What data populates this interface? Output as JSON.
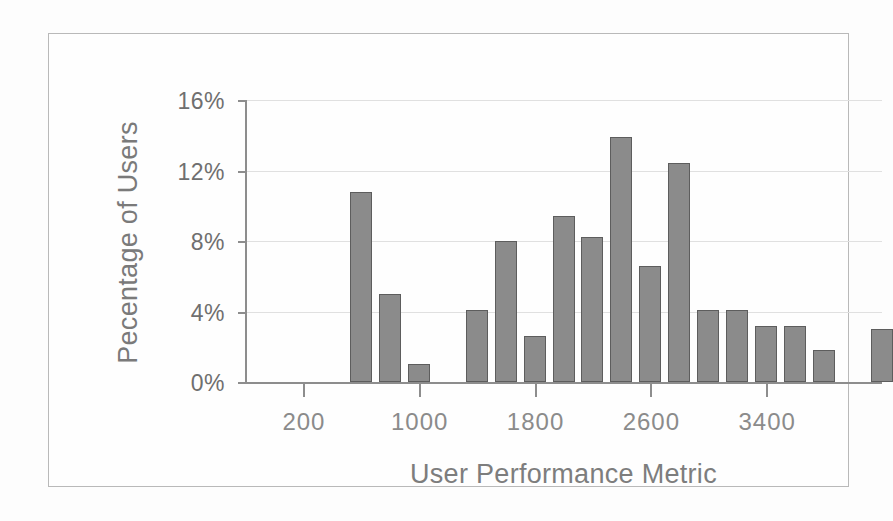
{
  "chart_data": {
    "type": "bar",
    "title": "",
    "subtitle": "",
    "xlabel": "User Performance Metric",
    "ylabel": "Pecentage of Users",
    "ylim": [
      0,
      16
    ],
    "ytick_values": [
      0,
      4,
      8,
      12,
      16
    ],
    "ytick_labels": [
      "0%",
      "4%",
      "8%",
      "12%",
      "16%"
    ],
    "xlim": [
      -200,
      4200
    ],
    "xtick_values": [
      200,
      1000,
      1800,
      2600,
      3400
    ],
    "xtick_labels": [
      "200",
      "1000",
      "1800",
      "2600",
      "3400"
    ],
    "grid": "horizontal",
    "legend": "none",
    "bar_color": "#8b8b8b",
    "bar_edge_color": "#5d5d5d",
    "axis_color": "#8d8d8d",
    "text_color": "#7a7a7a",
    "categories": [
      600,
      800,
      1000,
      1400,
      1600,
      1800,
      2000,
      2200,
      2400,
      2600,
      2800,
      3000,
      3200,
      3400,
      3600,
      3800,
      4200
    ],
    "values": [
      10.8,
      5.0,
      1.0,
      4.1,
      8.0,
      2.6,
      9.4,
      8.2,
      13.9,
      6.6,
      12.4,
      4.1,
      4.1,
      3.2,
      3.2,
      1.8,
      3.0
    ],
    "bars": [
      {
        "x": 600,
        "value": 10.8
      },
      {
        "x": 800,
        "value": 5.0
      },
      {
        "x": 1000,
        "value": 1.0
      },
      {
        "x": 1400,
        "value": 4.1
      },
      {
        "x": 1600,
        "value": 8.0
      },
      {
        "x": 1800,
        "value": 2.6
      },
      {
        "x": 2000,
        "value": 9.4
      },
      {
        "x": 2200,
        "value": 8.2
      },
      {
        "x": 2400,
        "value": 13.9
      },
      {
        "x": 2600,
        "value": 6.6
      },
      {
        "x": 2800,
        "value": 12.4
      },
      {
        "x": 3000,
        "value": 4.1
      },
      {
        "x": 3200,
        "value": 4.1
      },
      {
        "x": 3400,
        "value": 3.2
      },
      {
        "x": 3600,
        "value": 3.2
      },
      {
        "x": 3800,
        "value": 1.8
      },
      {
        "x": 4200,
        "value": 3.0
      }
    ]
  }
}
